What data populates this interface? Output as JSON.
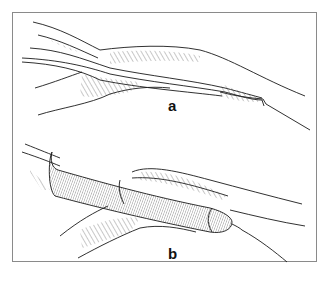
{
  "figure": {
    "panels": [
      {
        "id": "a",
        "label": "a",
        "description": "Vessel/duct anatomy, collapsed lumen with hatched surrounding tissue, tapering to a tip at right"
      },
      {
        "id": "b",
        "label": "b",
        "description": "Same structure with an inserted cylindrical device/balloon filling the lumen, wire exiting at right tip"
      }
    ],
    "colors": {
      "line": "#1a1a1a",
      "frame": "#8a8a8a",
      "background": "#ffffff"
    }
  }
}
